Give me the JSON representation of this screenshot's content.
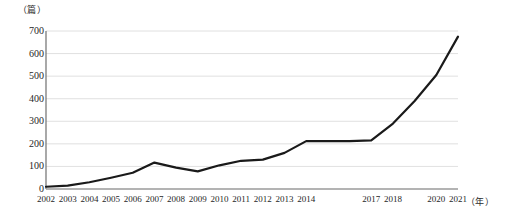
{
  "chart_data": {
    "type": "line",
    "title": "",
    "subtitle": "",
    "xlabel": "（年）",
    "ylabel": "（篇）",
    "y_unit_label": "（篇）",
    "x_unit_label": "（年）",
    "categories": [
      "2002",
      "2003",
      "2004",
      "2005",
      "2006",
      "2007",
      "2008",
      "2009",
      "2010",
      "2011",
      "2012",
      "2013",
      "2014",
      "2015",
      "2016",
      "2017",
      "2018",
      "2019",
      "2020",
      "2021"
    ],
    "visible_tick_labels": [
      "2002",
      "2003",
      "2004",
      "2005",
      "2006",
      "2007",
      "2008",
      "2009",
      "2010",
      "2011",
      "2012",
      "2013",
      "2014",
      "2017",
      "2018",
      "2020",
      "2021"
    ],
    "values": [
      10,
      15,
      30,
      50,
      72,
      117,
      95,
      78,
      105,
      125,
      130,
      160,
      212,
      212,
      212,
      215,
      290,
      390,
      505,
      675
    ],
    "series": [
      {
        "name": "发文量",
        "values": [
          10,
          15,
          30,
          50,
          72,
          117,
          95,
          78,
          105,
          125,
          130,
          160,
          212,
          212,
          212,
          215,
          290,
          390,
          505,
          675
        ]
      }
    ],
    "ylim": [
      0,
      700
    ],
    "yticks": [
      0,
      100,
      200,
      300,
      400,
      500,
      600,
      700
    ],
    "ytick_labels": [
      "0",
      "100",
      "200",
      "300",
      "400",
      "500",
      "600",
      "700"
    ],
    "xlim": [
      "2002",
      "2021"
    ],
    "grid": true,
    "grid_axis": "y",
    "legend": false,
    "legend_position": "none",
    "line_color": "#1a1a1a",
    "line_width": 2.2,
    "grid_color": "#d8d8d8",
    "axis_color": "#808080",
    "background": "#ffffff"
  }
}
